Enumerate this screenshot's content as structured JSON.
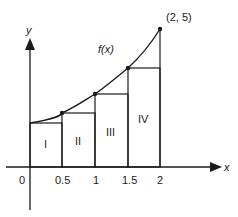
{
  "diagram": {
    "curve_label": "f(x)",
    "endpoint_label": "(2, 5)",
    "axes": {
      "x_label": "x",
      "y_label": "y",
      "origin_label": "0",
      "x_ticks": [
        "0.5",
        "1",
        "1.5",
        "2"
      ]
    },
    "rectangles": [
      {
        "label": "I",
        "x_from": 0,
        "x_to": 0.5
      },
      {
        "label": "II",
        "x_from": 0.5,
        "x_to": 1
      },
      {
        "label": "III",
        "x_from": 1,
        "x_to": 1.5
      },
      {
        "label": "IV",
        "x_from": 1.5,
        "x_to": 2
      }
    ],
    "colors": {
      "stroke": "#1a1a1a",
      "background": "#ffffff"
    }
  }
}
